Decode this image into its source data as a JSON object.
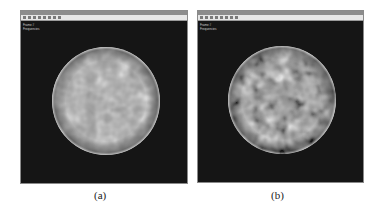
{
  "panels": [
    {
      "id": "a",
      "window_title": "",
      "overlay_lines": [
        "Frame #",
        "Frequencies"
      ],
      "caption": "(a)",
      "sphere": {
        "texture": "low-contrast noise",
        "base_color": "#9a9a9a"
      }
    },
    {
      "id": "b",
      "window_title": "",
      "overlay_lines": [
        "Frame #",
        "Frequencies"
      ],
      "caption": "(b)",
      "sphere": {
        "texture": "high-contrast noise",
        "base_color": "#a8a8a8"
      }
    }
  ],
  "colors": {
    "viewport_bg": "#151515",
    "titlebar": "#8c8c8c",
    "toolbar": "#e6e6e6"
  }
}
